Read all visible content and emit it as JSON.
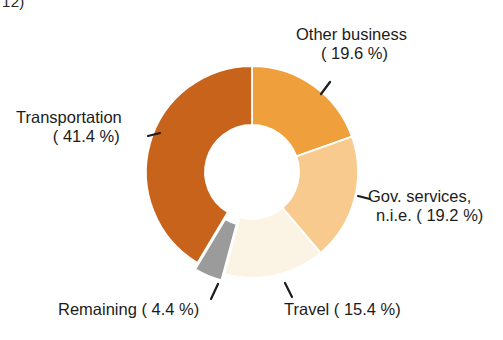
{
  "page": {
    "corner_text": "12)",
    "background_color": "#ffffff"
  },
  "chart_data": {
    "type": "pie",
    "variant": "donut",
    "title": "",
    "subtitle": "",
    "xlabel": "",
    "ylabel": "",
    "legend_position": "none",
    "grid": false,
    "units": "percent",
    "total": 100.0,
    "categories": [
      "Other business",
      "Gov. services, n.i.e.",
      "Travel",
      "Remaining",
      "Transportation"
    ],
    "values": [
      19.6,
      19.2,
      15.4,
      4.4,
      41.4
    ],
    "colors": [
      "#ef9f3c",
      "#f8ca8d",
      "#fbf4e4",
      "#9b9b9b",
      "#c7631a"
    ],
    "slices": [
      {
        "name": "Other business",
        "value": 19.6,
        "value_text": "19.6 %",
        "label_line1": "Other business",
        "label_line2": "( 19.6 %)",
        "color": "#ef9f3c",
        "exploded": false,
        "leader": true
      },
      {
        "name": "Gov. services, n.i.e.",
        "value": 19.2,
        "value_text": "19.2 %",
        "label_line1": "Gov. services,",
        "label_line2": "n.i.e. ( 19.2 %)",
        "color": "#f8ca8d",
        "exploded": false,
        "leader": true
      },
      {
        "name": "Travel",
        "value": 15.4,
        "value_text": "15.4 %",
        "label_line1": "Travel ( 15.4 %)",
        "label_line2": "",
        "color": "#fbf4e4",
        "exploded": false,
        "leader": true
      },
      {
        "name": "Remaining",
        "value": 4.4,
        "value_text": "4.4 %",
        "label_line1": "Remaining (  4.4 %)",
        "label_line2": "",
        "color": "#9b9b9b",
        "exploded": true,
        "leader": true
      },
      {
        "name": "Transportation",
        "value": 41.4,
        "value_text": "41.4 %",
        "label_line1": "Transportation",
        "label_line2": "( 41.4 %)",
        "color": "#c7631a",
        "exploded": false,
        "leader": true
      }
    ],
    "geometry": {
      "center_x": 252,
      "center_y": 172,
      "outer_radius": 106,
      "inner_radius": 47,
      "start_angle_deg": 0,
      "direction": "clockwise"
    }
  }
}
